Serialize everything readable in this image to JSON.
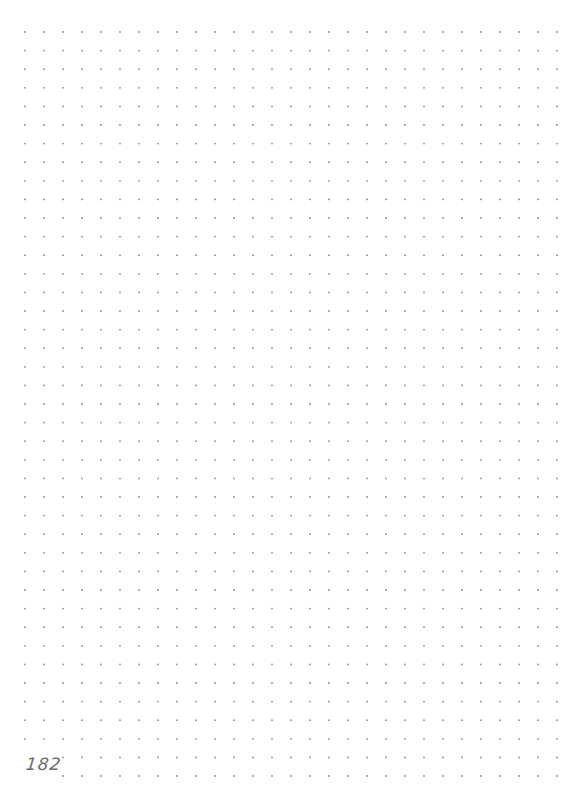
{
  "page": {
    "type": "dot-grid notebook page",
    "page_number": "182",
    "background_color": "#ffffff"
  },
  "dot_grid": {
    "color": "#8a8a8a",
    "dot_radius": 0.9,
    "origin_x": 25,
    "origin_y": 32,
    "spacing_x": 19,
    "spacing_y": 18.6,
    "columns": 29,
    "rows": 41,
    "omitted_region": {
      "rows_from": 39,
      "rows_to": 40,
      "cols_from": 0,
      "cols_to": 1
    }
  }
}
